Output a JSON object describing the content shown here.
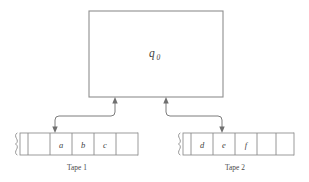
{
  "figure": {
    "type": "turing-machine-multitape-diagram",
    "background_color": "#ffffff",
    "line_color": "#8a8a8a",
    "text_color": "#3f3f3f"
  },
  "control_unit": {
    "name": "finite-control",
    "state_symbol": "q",
    "state_subscript": "0",
    "state_label_full": "q0",
    "box": {
      "x": 89,
      "y": 11,
      "width": 134,
      "height": 86
    }
  },
  "tapes": [
    {
      "id": "tape-1",
      "caption": "Tape 1",
      "caption_position": {
        "x": 77,
        "y": 170
      },
      "left_end": "squiggle-brace",
      "right_end": "squiggle-brace",
      "head_cell_index": 2,
      "cells": [
        {
          "index": 0,
          "symbol": ""
        },
        {
          "index": 1,
          "symbol": ""
        },
        {
          "index": 2,
          "symbol": "a"
        },
        {
          "index": 3,
          "symbol": "b"
        },
        {
          "index": 4,
          "symbol": "c"
        },
        {
          "index": 5,
          "symbol": ""
        }
      ]
    },
    {
      "id": "tape-2",
      "caption": "Tape 2",
      "caption_position": {
        "x": 235,
        "y": 170
      },
      "left_end": "squiggle-brace",
      "right_end": "squiggle-brace",
      "head_cell_index": 1,
      "cells": [
        {
          "index": 0,
          "symbol": ""
        },
        {
          "index": 1,
          "symbol": "d"
        },
        {
          "index": 2,
          "symbol": "e"
        },
        {
          "index": 3,
          "symbol": "f"
        },
        {
          "index": 4,
          "symbol": ""
        }
      ]
    }
  ],
  "head_connectors": [
    {
      "id": "head-connector-1",
      "from": "control-box-bottom",
      "to": "tape-1-head",
      "arrowheads": "both",
      "path_style": "rounded-step-left"
    },
    {
      "id": "head-connector-2",
      "from": "control-box-bottom",
      "to": "tape-2-head",
      "arrowheads": "both",
      "path_style": "rounded-step-right"
    }
  ]
}
